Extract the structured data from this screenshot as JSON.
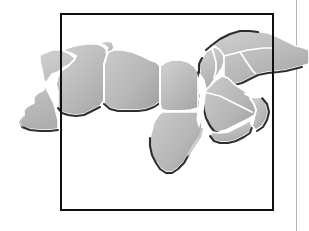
{
  "figure": {
    "kind": "map",
    "title": "",
    "caption": "",
    "region_name": "North Africa and the Middle East",
    "frame": {
      "visible": true,
      "left": 60,
      "top": 13,
      "width": 214,
      "height": 198,
      "border_color": "#101010",
      "border_width_px": 2.5
    },
    "margin_rule": {
      "visible": true,
      "x": 296,
      "color": "#b4b4b4",
      "width_px": 1
    },
    "page": {
      "width": 309,
      "height": 231,
      "background": "#ffffff"
    }
  },
  "style": {
    "land_fill_light": "#d2d2d2",
    "land_fill_mid": "#bcbcbc",
    "land_fill_dark": "#a8a8a8",
    "internal_border_color": "#ffffff",
    "coast_shadow_color": "#1c1c1c",
    "sea_color": "#ffffff"
  },
  "map_regions": [
    {
      "name": "morocco-western-sahara",
      "label": "",
      "overflows_frame": "left"
    },
    {
      "name": "algeria",
      "label": "",
      "overflows_frame": "none"
    },
    {
      "name": "tunisia",
      "label": "",
      "overflows_frame": "none"
    },
    {
      "name": "libya",
      "label": "",
      "overflows_frame": "none"
    },
    {
      "name": "egypt",
      "label": "",
      "overflows_frame": "none"
    },
    {
      "name": "sudan",
      "label": "",
      "overflows_frame": "none"
    },
    {
      "name": "levant-syria-lebanon-jordan-israel",
      "label": "",
      "overflows_frame": "none"
    },
    {
      "name": "iraq-turkey-iran-north",
      "label": "",
      "overflows_frame": "right"
    },
    {
      "name": "saudi-arabia",
      "label": "",
      "overflows_frame": "none"
    },
    {
      "name": "yemen",
      "label": "",
      "overflows_frame": "none"
    },
    {
      "name": "oman-uae-gulf-states",
      "label": "",
      "overflows_frame": "none"
    }
  ],
  "map_data": {
    "type": "choropleth-outline",
    "projection_hint": "unspecified",
    "labels": [],
    "legend": [],
    "annotations": [],
    "gridlines": false,
    "scale_bar": false,
    "north_arrow": false
  }
}
